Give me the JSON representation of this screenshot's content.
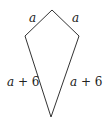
{
  "figure": {
    "shape": "kite",
    "labels": {
      "top_left_side": "a",
      "top_right_side": "a",
      "bottom_left_side": "a + 6",
      "bottom_right_side": "a + 6"
    },
    "line_color": "#333333"
  }
}
